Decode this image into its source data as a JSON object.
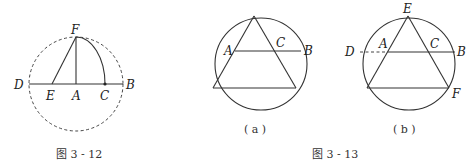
{
  "figures": [
    {
      "id": "fig-3-12",
      "caption": "图 3 - 12",
      "labels": {
        "F": "F",
        "D": "D",
        "E": "E",
        "A": "A",
        "C": "C",
        "B": "B"
      }
    },
    {
      "id": "fig-3-13",
      "caption": "图 3 - 13",
      "subfigures": [
        {
          "caption": "( a )",
          "labels": {
            "A": "A",
            "C": "C",
            "B": "B"
          }
        },
        {
          "caption": "( b )",
          "labels": {
            "E": "E",
            "D": "D",
            "A": "A",
            "C": "C",
            "B": "B",
            "F": "F"
          }
        }
      ]
    }
  ]
}
